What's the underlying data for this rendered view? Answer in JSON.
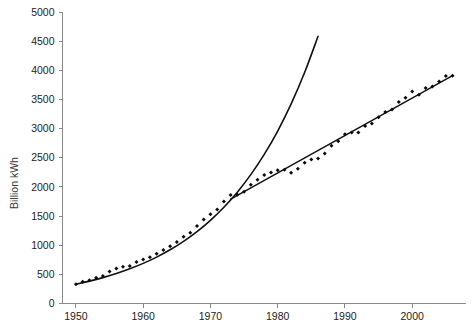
{
  "chart_data": {
    "type": "scatter",
    "title": "",
    "subtitle": "",
    "xlabel": "",
    "ylabel": "Billion kWh",
    "xlim": [
      1948,
      2008
    ],
    "ylim": [
      0,
      5000
    ],
    "grid": false,
    "legend": "none",
    "x_ticks": [
      "1950",
      "1960",
      "1970",
      "1980",
      "1990",
      "2000"
    ],
    "x_tick_values": [
      1950,
      1960,
      1970,
      1980,
      1990,
      2000
    ],
    "y_ticks": [
      "0",
      "500",
      "1000",
      "1500",
      "2000",
      "2500",
      "3000",
      "3500",
      "4000",
      "4500",
      "5000"
    ],
    "y_tick_values": [
      0,
      500,
      1000,
      1500,
      2000,
      2500,
      3000,
      3500,
      4000,
      4500,
      5000
    ],
    "series": [
      {
        "name": "Observed electricity generation",
        "type": "scatter",
        "marker": "diamond",
        "color": "#0b0b0b",
        "x": [
          1950,
          1951,
          1952,
          1953,
          1954,
          1955,
          1956,
          1957,
          1958,
          1959,
          1960,
          1961,
          1962,
          1963,
          1964,
          1965,
          1966,
          1967,
          1968,
          1969,
          1970,
          1971,
          1972,
          1973,
          1974,
          1975,
          1976,
          1977,
          1978,
          1979,
          1980,
          1981,
          1982,
          1983,
          1984,
          1985,
          1986,
          1987,
          1988,
          1989,
          1990,
          1991,
          1992,
          1993,
          1994,
          1995,
          1996,
          1997,
          1998,
          1999,
          2000,
          2001,
          2002,
          2003,
          2004,
          2005,
          2006
        ],
        "y": [
          330,
          371,
          399,
          443,
          471,
          547,
          601,
          632,
          645,
          710,
          753,
          794,
          855,
          918,
          984,
          1055,
          1144,
          1214,
          1329,
          1442,
          1532,
          1613,
          1750,
          1861,
          1867,
          1918,
          2038,
          2124,
          2206,
          2247,
          2286,
          2295,
          2241,
          2310,
          2416,
          2470,
          2487,
          2572,
          2704,
          2784,
          2901,
          2935,
          2934,
          3044,
          3089,
          3194,
          3284,
          3329,
          3457,
          3530,
          3638,
          3580,
          3698,
          3721,
          3808,
          3902,
          3908
        ]
      },
      {
        "name": "Exponential trend fitted to 1950-1973",
        "type": "line",
        "color": "#111111",
        "x": [
          1950,
          1952,
          1954,
          1956,
          1958,
          1960,
          1962,
          1964,
          1966,
          1968,
          1970,
          1972,
          1974,
          1976,
          1978,
          1980,
          1982,
          1984,
          1986
        ],
        "y": [
          332,
          384,
          444,
          514,
          595,
          688,
          796,
          921,
          1066,
          1233,
          1427,
          1651,
          1910,
          2210,
          2557,
          2958,
          3423,
          3961,
          4583
        ]
      },
      {
        "name": "Linear trend fitted to 1974-2006",
        "type": "line",
        "color": "#111111",
        "x": [
          1973,
          2006
        ],
        "y": [
          1790,
          3910
        ]
      }
    ],
    "annotations": [
      {
        "text": "Exponential growth trend breaks after 1973; subsequent growth is approximately linear.",
        "visible": false
      }
    ]
  },
  "axes": {
    "y_axis_title": "Billion kWh"
  }
}
